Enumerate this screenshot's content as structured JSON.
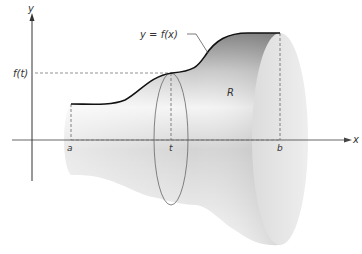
{
  "figure": {
    "labels": {
      "y_axis": "y",
      "x_axis": "x",
      "f_t": "f(t)",
      "curve": "y = f(x)",
      "region": "R",
      "a": "a",
      "t": "t",
      "b": "b"
    },
    "colors": {
      "axis": "#444444",
      "curve": "#111111",
      "dashed": "#666666",
      "solid_dark": "#8a8a8a",
      "solid_light": "#f2f2f2",
      "end_disk": "#e6e6e6"
    }
  }
}
